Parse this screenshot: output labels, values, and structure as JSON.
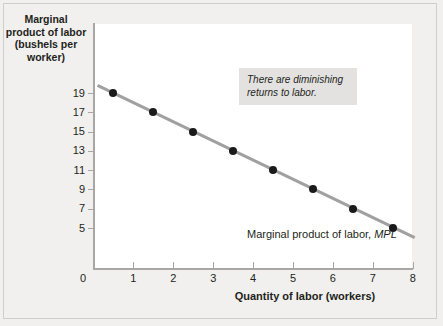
{
  "chart_data": {
    "type": "scatter",
    "title": "",
    "xlabel": "Quantity of labor (workers)",
    "ylabel": "Marginal product of labor (bushels per worker)",
    "ylabel_lines": [
      "Marginal",
      "product of labor",
      "(bushels per",
      "worker)"
    ],
    "x": [
      0.5,
      1.5,
      2.5,
      3.5,
      4.5,
      5.5,
      6.5,
      7.5
    ],
    "values": [
      19,
      17,
      15,
      13,
      11,
      9,
      7,
      5
    ],
    "series": [
      {
        "name": "Marginal product of labor, MPL",
        "x": [
          0.5,
          1.5,
          2.5,
          3.5,
          4.5,
          5.5,
          6.5,
          7.5
        ],
        "values": [
          19,
          17,
          15,
          13,
          11,
          9,
          7,
          5
        ]
      }
    ],
    "xlim": [
      0,
      8
    ],
    "ylim": [
      0,
      20
    ],
    "xticks": [
      0,
      1,
      2,
      3,
      4,
      5,
      6,
      7,
      8
    ],
    "xtick_labels": [
      "0",
      "1",
      "2",
      "3",
      "4",
      "5",
      "6",
      "7",
      "8"
    ],
    "yticks": [
      19,
      17,
      15,
      13,
      11,
      9,
      7,
      5
    ],
    "ytick_labels": [
      "19",
      "17",
      "15",
      "13",
      "11",
      "9",
      "7",
      "5"
    ],
    "origin_label": "0",
    "grid": false,
    "legend_position": "none",
    "trend_line": {
      "color": "#a0a0a0",
      "width": 3,
      "from_x": 0.1,
      "from_y": 19.8,
      "to_x": 8.05,
      "to_y": 4.0
    },
    "annotations": [
      {
        "name": "diminishing-returns-note",
        "text": "There are diminishing returns to labor.",
        "lines": [
          "There are diminishing",
          "returns to labor."
        ],
        "style": "italic",
        "background": "#e3e2e0"
      },
      {
        "name": "series-label",
        "text_prefix": "Marginal product of labor, ",
        "text_italic": "MPL"
      }
    ],
    "colors": {
      "point": "#1a1a1a",
      "line": "#a0a0a0",
      "axis": "#a8a7a4",
      "plot_background": "#ffffff",
      "figure_background": "#f1f0ee",
      "text": "#231f20",
      "annotation_background": "#e3e2e0"
    }
  }
}
